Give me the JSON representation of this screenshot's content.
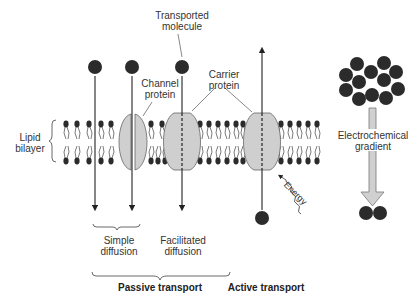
{
  "labels": {
    "transported_molecule": [
      "Transported",
      "molecule"
    ],
    "channel_protein": [
      "Channel",
      "protein"
    ],
    "carrier_protein": [
      "Carrier",
      "protein"
    ],
    "lipid_bilayer": [
      "Lipid",
      "bilayer"
    ],
    "electrochemical_gradient": [
      "Electrochemical",
      "gradient"
    ],
    "energy": "Energy",
    "simple_diffusion": [
      "Simple",
      "diffusion"
    ],
    "facilitated_diffusion": [
      "Facilitated",
      "diffusion"
    ],
    "passive_transport": "Passive transport",
    "active_transport": "Active transport"
  },
  "colors": {
    "molecule": "#2b2b2b",
    "protein_fill": "#cfcfcf",
    "protein_stroke": "#555555",
    "arrow_fill": "#d0d0d0",
    "line": "#222222",
    "text": "#333333"
  }
}
